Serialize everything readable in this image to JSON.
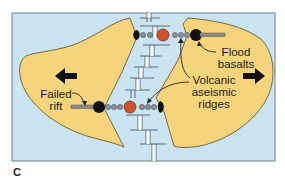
{
  "figure": {
    "panel_letter": "C",
    "colors": {
      "ocean": "#cbe4f1",
      "continent": "#f5d47c",
      "continent_outline": "#5a4a2a",
      "frame": "#6f7f88",
      "hotspot": "#d2532b",
      "seamount": "#8a9298",
      "plume_head": "#111111",
      "ridge_line": "#5b6a74"
    },
    "labels": {
      "flood_basalts_line1": "Flood",
      "flood_basalts_line2": "basalts",
      "volcanic_line1": "Volcanic",
      "volcanic_line2": "aseismic",
      "volcanic_line3": "ridges",
      "failed_rift_line1": "Failed",
      "failed_rift_line2": "rift"
    },
    "arrows": {
      "left_motion": "plate-moving-left",
      "right_motion": "plate-moving-right"
    }
  }
}
